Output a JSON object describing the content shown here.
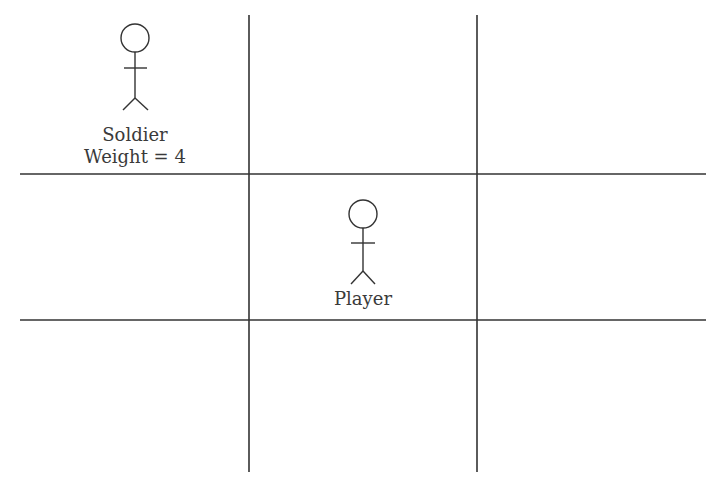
{
  "diagram": {
    "type": "grid",
    "rows": 3,
    "cols": 3,
    "line_color": "#333333",
    "characters": [
      {
        "name": "Soldier",
        "lines": [
          "Soldier",
          "Weight = 4"
        ],
        "cell": [
          0,
          0
        ]
      },
      {
        "name": "Player",
        "lines": [
          "Player"
        ],
        "cell": [
          1,
          1
        ]
      }
    ]
  }
}
